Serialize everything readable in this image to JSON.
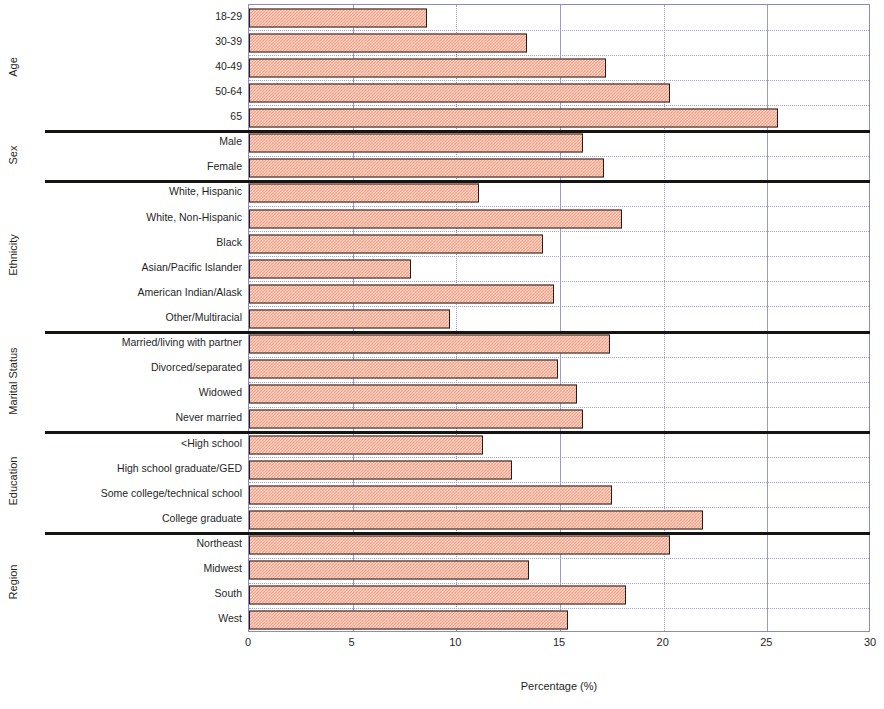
{
  "chart_data": {
    "type": "bar",
    "orientation": "horizontal",
    "title": "",
    "xlabel": "Percentage (%)",
    "ylabel": "",
    "xlim": [
      0,
      30
    ],
    "xticks": [
      0,
      5,
      10,
      15,
      20,
      25,
      30
    ],
    "grid": true,
    "legend": null,
    "bar_color": "#f0a78d",
    "bar_edge_color": "#231f1c",
    "frame_color": "#8b8bc4",
    "gridline_color": "#9a9ad0",
    "separator_color": "#171310",
    "groups": [
      {
        "name": "Age",
        "categories": [
          "18-29",
          "30-39",
          "40-49",
          "50-64",
          "65"
        ],
        "values": [
          8.6,
          13.4,
          17.2,
          20.3,
          25.5
        ]
      },
      {
        "name": "Sex",
        "categories": [
          "Male",
          "Female"
        ],
        "values": [
          16.1,
          17.1
        ]
      },
      {
        "name": "Ethnicity",
        "categories": [
          "White, Hispanic",
          "White, Non-Hispanic",
          "Black",
          "Asian/Pacific Islander",
          "American Indian/Alask",
          "Other/Multiracial"
        ],
        "values": [
          11.1,
          18.0,
          14.2,
          7.8,
          14.7,
          9.7
        ]
      },
      {
        "name": "Marital Status",
        "categories": [
          "Married/living with partner",
          "Divorced/separated",
          "Widowed",
          "Never married"
        ],
        "values": [
          17.4,
          14.9,
          15.8,
          16.1
        ]
      },
      {
        "name": "Education",
        "categories": [
          "<High school",
          "High school graduate/GED",
          "Some college/technical school",
          "College graduate"
        ],
        "values": [
          11.3,
          12.7,
          17.5,
          21.9
        ]
      },
      {
        "name": "Region",
        "categories": [
          "Northeast",
          "Midwest",
          "South",
          "West"
        ],
        "values": [
          20.3,
          13.5,
          18.2,
          15.4
        ]
      }
    ],
    "categories": [
      "18-29",
      "30-39",
      "40-49",
      "50-64",
      "65",
      "Male",
      "Female",
      "White, Hispanic",
      "White, Non-Hispanic",
      "Black",
      "Asian/Pacific Islander",
      "American Indian/Alask",
      "Other/Multiracial",
      "Married/living with partner",
      "Divorced/separated",
      "Widowed",
      "Never married",
      "<High school",
      "High school graduate/GED",
      "Some college/technical school",
      "College graduate",
      "Northeast",
      "Midwest",
      "South",
      "West"
    ],
    "values": [
      8.6,
      13.4,
      17.2,
      20.3,
      25.5,
      16.1,
      17.1,
      11.1,
      18.0,
      14.2,
      7.8,
      14.7,
      9.7,
      17.4,
      14.9,
      15.8,
      16.1,
      11.3,
      12.7,
      17.5,
      21.9,
      20.3,
      13.5,
      18.2,
      15.4
    ]
  }
}
